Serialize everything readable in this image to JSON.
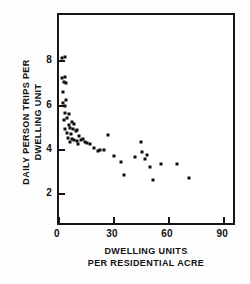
{
  "chart_data": {
    "type": "scatter",
    "title": "",
    "subtitle": "",
    "xlabel": "DWELLING UNITS PER RESIDENTIAL ACRE",
    "xlabel_line1": "DWELLING UNITS",
    "xlabel_line2": "PER RESIDENTIAL ACRE",
    "ylabel": "DAILY PERSON TRIPS PER DWELLING UNIT",
    "ylabel_line1": "DAILY PERSON TRIPS PER",
    "ylabel_line2": "DWELLING UNIT",
    "xlim": [
      0,
      97
    ],
    "ylim": [
      0.5,
      10.1
    ],
    "xticks": [
      0,
      30,
      60,
      90
    ],
    "xticklabels": [
      "0",
      "30",
      "60",
      "90"
    ],
    "yticks": [
      2,
      4,
      6,
      8
    ],
    "yticklabels": [
      "2",
      "4",
      "6",
      "8"
    ],
    "grid": false,
    "legend": null,
    "tick_direction": "in",
    "marker": "filled-square",
    "marker_color": "#0d0d0d",
    "frame_color": "#161616",
    "background": "#ffffff",
    "points": [
      [
        1.5,
        8.15
      ],
      [
        3.0,
        8.2
      ],
      [
        1.8,
        7.25
      ],
      [
        3.2,
        7.3
      ],
      [
        2.6,
        7.05
      ],
      [
        3.6,
        7.0
      ],
      [
        2.2,
        6.6
      ],
      [
        4.0,
        6.25
      ],
      [
        2.4,
        6.1
      ],
      [
        3.0,
        6.0
      ],
      [
        3.4,
        5.65
      ],
      [
        5.5,
        5.6
      ],
      [
        2.8,
        5.35
      ],
      [
        4.6,
        5.45
      ],
      [
        5.2,
        5.1
      ],
      [
        7.0,
        5.25
      ],
      [
        3.2,
        4.95
      ],
      [
        6.0,
        5.0
      ],
      [
        7.6,
        4.95
      ],
      [
        8.4,
        5.15
      ],
      [
        4.4,
        4.75
      ],
      [
        6.6,
        4.7
      ],
      [
        9.0,
        4.85
      ],
      [
        10.0,
        4.9
      ],
      [
        5.0,
        4.55
      ],
      [
        7.2,
        4.5
      ],
      [
        8.0,
        4.45
      ],
      [
        11.0,
        4.6
      ],
      [
        6.0,
        4.35
      ],
      [
        9.6,
        4.4
      ],
      [
        12.0,
        4.45
      ],
      [
        13.0,
        4.5
      ],
      [
        10.5,
        4.25
      ],
      [
        14.0,
        4.35
      ],
      [
        15.5,
        4.3
      ],
      [
        17.0,
        4.25
      ],
      [
        19.0,
        4.1
      ],
      [
        21.0,
        3.95
      ],
      [
        22.5,
        4.0
      ],
      [
        24.5,
        4.0
      ],
      [
        26.5,
        4.65
      ],
      [
        30.0,
        3.7
      ],
      [
        34.0,
        3.45
      ],
      [
        35.5,
        2.85
      ],
      [
        41.5,
        3.65
      ],
      [
        44.5,
        4.35
      ],
      [
        45.5,
        3.9
      ],
      [
        47.0,
        3.6
      ],
      [
        48.0,
        3.75
      ],
      [
        49.5,
        3.2
      ],
      [
        51.0,
        2.65
      ],
      [
        55.5,
        3.35
      ],
      [
        64.5,
        3.35
      ],
      [
        71.0,
        2.7
      ],
      [
        97.0,
        2.35
      ]
    ]
  }
}
